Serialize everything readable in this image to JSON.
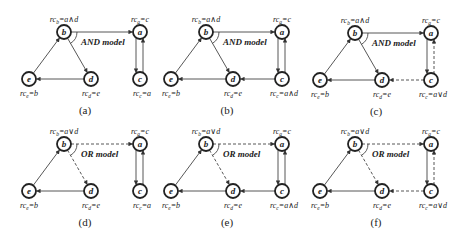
{
  "figure": {
    "panels": [
      {
        "id": "a",
        "caption": "(a)",
        "model": "AND model",
        "offset": [
          0,
          0
        ],
        "labels": {
          "b": [
            "rc",
            "b",
            "=a∧d"
          ],
          "a": [
            "rc",
            "a",
            "=c"
          ],
          "e": [
            "rc",
            "e",
            "=b"
          ],
          "d": [
            "rc",
            "d",
            "=e"
          ],
          "c": [
            "rc",
            "c",
            "=a"
          ]
        },
        "edges": [
          {
            "from": "b",
            "to": "a",
            "style": "solid"
          },
          {
            "from": "b",
            "to": "d",
            "style": "solid"
          },
          {
            "from": "d",
            "to": "e",
            "style": "solid"
          },
          {
            "from": "e",
            "to": "b",
            "style": "solid"
          },
          {
            "from": "a",
            "to": "c",
            "style": "solid"
          },
          {
            "from": "c",
            "to": "a",
            "style": "solid"
          }
        ]
      },
      {
        "id": "b",
        "caption": "(b)",
        "model": "AND model",
        "offset": [
          142,
          0
        ],
        "labels": {
          "b": [
            "rc",
            "b",
            "=a∧d"
          ],
          "a": [
            "rc",
            "a",
            "=c"
          ],
          "e": [
            "rc",
            "e",
            "=b"
          ],
          "d": [
            "rc",
            "d",
            "=e"
          ],
          "c": [
            "rc",
            "c",
            "=a∧d"
          ]
        },
        "edges": [
          {
            "from": "b",
            "to": "a",
            "style": "solid"
          },
          {
            "from": "b",
            "to": "d",
            "style": "solid"
          },
          {
            "from": "d",
            "to": "e",
            "style": "solid"
          },
          {
            "from": "e",
            "to": "b",
            "style": "solid"
          },
          {
            "from": "a",
            "to": "c",
            "style": "solid"
          },
          {
            "from": "c",
            "to": "a",
            "style": "solid"
          },
          {
            "from": "c",
            "to": "d",
            "style": "solid"
          }
        ]
      },
      {
        "id": "c",
        "caption": "(c)",
        "model": "AND model",
        "offset": [
          291,
          1
        ],
        "labels": {
          "b": [
            "rc",
            "b",
            "=a∧d"
          ],
          "a": [
            "rc",
            "a",
            "=c"
          ],
          "e": [
            "rc",
            "e",
            "=b"
          ],
          "d": [
            "rc",
            "d",
            "=e"
          ],
          "c": [
            "rc",
            "c",
            "=a∨d"
          ]
        },
        "edges": [
          {
            "from": "b",
            "to": "a",
            "style": "solid"
          },
          {
            "from": "b",
            "to": "d",
            "style": "solid"
          },
          {
            "from": "d",
            "to": "e",
            "style": "solid"
          },
          {
            "from": "e",
            "to": "b",
            "style": "solid"
          },
          {
            "from": "a",
            "to": "c",
            "style": "solid"
          },
          {
            "from": "c",
            "to": "a",
            "style": "dashed"
          },
          {
            "from": "c",
            "to": "d",
            "style": "dashed"
          }
        ]
      },
      {
        "id": "d",
        "caption": "(d)",
        "model": "OR model",
        "offset": [
          0,
          112
        ],
        "labels": {
          "b": [
            "rc",
            "b",
            "=a∨d"
          ],
          "a": [
            "rc",
            "a",
            "=c"
          ],
          "e": [
            "rc",
            "e",
            "=b"
          ],
          "d": [
            "rc",
            "d",
            "=e"
          ],
          "c": [
            "rc",
            "c",
            "=a"
          ]
        },
        "edges": [
          {
            "from": "b",
            "to": "a",
            "style": "dashed"
          },
          {
            "from": "b",
            "to": "d",
            "style": "dashed"
          },
          {
            "from": "d",
            "to": "e",
            "style": "solid"
          },
          {
            "from": "e",
            "to": "b",
            "style": "solid"
          },
          {
            "from": "a",
            "to": "c",
            "style": "solid"
          },
          {
            "from": "c",
            "to": "a",
            "style": "solid"
          }
        ]
      },
      {
        "id": "e",
        "caption": "(e)",
        "model": "OR model",
        "offset": [
          142,
          112
        ],
        "labels": {
          "b": [
            "rc",
            "b",
            "=a∨d"
          ],
          "a": [
            "rc",
            "a",
            "=c"
          ],
          "e": [
            "rc",
            "e",
            "=b"
          ],
          "d": [
            "rc",
            "d",
            "=e"
          ],
          "c": [
            "rc",
            "c",
            "=a∧d"
          ]
        },
        "edges": [
          {
            "from": "b",
            "to": "a",
            "style": "dashed"
          },
          {
            "from": "b",
            "to": "d",
            "style": "dashed"
          },
          {
            "from": "d",
            "to": "e",
            "style": "solid"
          },
          {
            "from": "e",
            "to": "b",
            "style": "solid"
          },
          {
            "from": "a",
            "to": "c",
            "style": "solid"
          },
          {
            "from": "c",
            "to": "a",
            "style": "solid"
          },
          {
            "from": "c",
            "to": "d",
            "style": "solid"
          }
        ]
      },
      {
        "id": "f",
        "caption": "(f)",
        "model": "OR model",
        "offset": [
          291,
          112
        ],
        "labels": {
          "b": [
            "rc",
            "b",
            "=a∨d"
          ],
          "a": [
            "rc",
            "a",
            "=c"
          ],
          "e": [
            "rc",
            "e",
            "=b"
          ],
          "d": [
            "rc",
            "d",
            "=e"
          ],
          "c": [
            "rc",
            "c",
            "=a∨d"
          ]
        },
        "edges": [
          {
            "from": "b",
            "to": "a",
            "style": "dashed"
          },
          {
            "from": "b",
            "to": "d",
            "style": "dashed"
          },
          {
            "from": "d",
            "to": "e",
            "style": "solid"
          },
          {
            "from": "e",
            "to": "b",
            "style": "solid"
          },
          {
            "from": "a",
            "to": "c",
            "style": "solid"
          },
          {
            "from": "c",
            "to": "a",
            "style": "dashed"
          },
          {
            "from": "c",
            "to": "d",
            "style": "dashed"
          }
        ]
      }
    ],
    "node_layout": {
      "b": [
        64,
        32
      ],
      "a": [
        140,
        32
      ],
      "e": [
        29,
        79
      ],
      "d": [
        91,
        79
      ],
      "c": [
        140,
        79
      ]
    },
    "node_radius": 7,
    "colors": {
      "stroke": "#222222",
      "edge": "#444444",
      "background": "#ffffff"
    }
  }
}
